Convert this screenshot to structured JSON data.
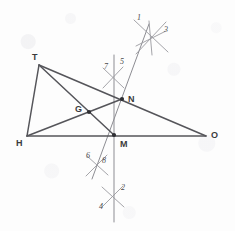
{
  "figure": {
    "kind": "compass-and-straightedge geometry construction",
    "canvas": {
      "width": 235,
      "height": 231
    },
    "colors": {
      "background": "#fdfdfd",
      "segment_stroke": "#55555a",
      "construction_stroke": "#8d8d93",
      "arc_stroke": "#9a9a9f",
      "point_fill": "#2f2f33",
      "vertex_label": "#3a3a3c",
      "arc_label": "#4a4a4c"
    },
    "points": [
      {
        "id": "T",
        "label": "T",
        "x": 39,
        "y": 65,
        "marked": false,
        "label_x": 32,
        "label_y": 53
      },
      {
        "id": "H",
        "label": "H",
        "x": 27,
        "y": 136,
        "marked": false,
        "label_x": 16,
        "label_y": 139
      },
      {
        "id": "O",
        "label": "O",
        "x": 206,
        "y": 136,
        "marked": false,
        "label_x": 211,
        "label_y": 131
      },
      {
        "id": "N",
        "label": "N",
        "x": 122,
        "y": 99,
        "marked": true,
        "label_x": 128,
        "label_y": 95
      },
      {
        "id": "M",
        "label": "M",
        "x": 114,
        "y": 135,
        "marked": true,
        "label_x": 120,
        "label_y": 140
      },
      {
        "id": "G",
        "label": "G",
        "x": 89,
        "y": 112,
        "marked": true,
        "label_x": 75,
        "label_y": 105
      }
    ],
    "segments": [
      {
        "name": "side-TH",
        "from": "T",
        "to": "H"
      },
      {
        "name": "side-HO",
        "from": "H",
        "to": "O"
      },
      {
        "name": "side-TO",
        "from": "T",
        "to": "O"
      },
      {
        "name": "cevian-T-to-M",
        "from": "T",
        "to": "M"
      },
      {
        "name": "cevian-H-to-N",
        "from": "H",
        "to": "N"
      }
    ],
    "construction_lines": [
      {
        "name": "perpendicular-bisector-vertical",
        "x1": 114,
        "y1": 55,
        "x2": 114,
        "y2": 222
      },
      {
        "name": "perpendicular-bisector-oblique",
        "x1": 149,
        "y1": 24,
        "x2": 92,
        "y2": 179
      }
    ],
    "arc_marks": [
      {
        "name": "arc-pair-top-right",
        "center_x": 150,
        "center_y": 37,
        "labels": [
          {
            "text": "1",
            "x": 137,
            "y": 14
          },
          {
            "text": "3",
            "x": 164,
            "y": 26
          }
        ],
        "strokes": [
          {
            "x1": 134,
            "y1": 20,
            "x2": 168,
            "y2": 52
          },
          {
            "x1": 166,
            "y1": 22,
            "x2": 136,
            "y2": 54
          },
          {
            "x1": 136,
            "y1": 46,
            "x2": 166,
            "y2": 31
          },
          {
            "x1": 149,
            "y1": 21,
            "x2": 152,
            "y2": 55
          }
        ]
      },
      {
        "name": "arc-pair-upper-middle",
        "center_x": 113,
        "center_y": 77,
        "labels": [
          {
            "text": "7",
            "x": 104,
            "y": 63
          },
          {
            "text": "5",
            "x": 120,
            "y": 58
          }
        ],
        "strokes": [
          {
            "x1": 103,
            "y1": 68,
            "x2": 124,
            "y2": 88
          },
          {
            "x1": 123,
            "y1": 67,
            "x2": 103,
            "y2": 88
          }
        ]
      },
      {
        "name": "arc-pair-lower-middle",
        "center_x": 97,
        "center_y": 164,
        "labels": [
          {
            "text": "6",
            "x": 86,
            "y": 152
          },
          {
            "text": "8",
            "x": 102,
            "y": 157
          }
        ],
        "strokes": [
          {
            "x1": 87,
            "y1": 156,
            "x2": 108,
            "y2": 175
          },
          {
            "x1": 107,
            "y1": 155,
            "x2": 86,
            "y2": 176
          }
        ]
      },
      {
        "name": "arc-pair-bottom",
        "center_x": 113,
        "center_y": 196,
        "labels": [
          {
            "text": "2",
            "x": 121,
            "y": 184
          },
          {
            "text": "4",
            "x": 99,
            "y": 203
          }
        ],
        "strokes": [
          {
            "x1": 102,
            "y1": 187,
            "x2": 124,
            "y2": 207
          },
          {
            "x1": 123,
            "y1": 186,
            "x2": 102,
            "y2": 207
          }
        ]
      }
    ]
  }
}
